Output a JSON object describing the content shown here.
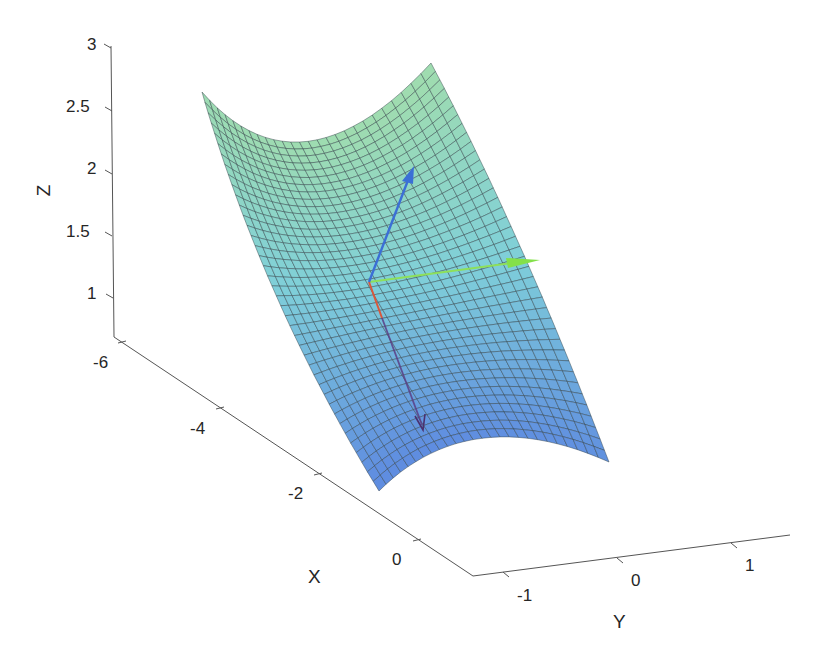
{
  "chart_data": {
    "type": "surface3d",
    "title": "",
    "xlabel": "X",
    "ylabel": "Y",
    "zlabel": "Z",
    "x_ticks": [
      "-6",
      "-4",
      "-2",
      "0"
    ],
    "y_ticks": [
      "-1",
      "0",
      "1"
    ],
    "z_ticks": [
      "1",
      "1.5",
      "2",
      "2.5",
      "3"
    ],
    "xlim": [
      -6.5,
      1
    ],
    "ylim": [
      -1.3,
      1.5
    ],
    "zlim": [
      0.75,
      3
    ],
    "grid": false,
    "surface": {
      "description": "saddle/trough-shaped parametric surface with mesh grid; curved trough along X",
      "colormap": "green (high Z) to blue (low Z)",
      "color_top": "#9fdcb0",
      "color_mid": "#7fcfd9",
      "color_bottom": "#5f8de0",
      "mesh_color": "#2f3f46",
      "grid_cols": 26,
      "grid_rows": 40
    },
    "vectors": [
      {
        "name": "blue-vector",
        "color": "#3b6fd6",
        "direction": "up (normal)"
      },
      {
        "name": "green-vector",
        "color": "#7fe04a",
        "direction": "+Y"
      },
      {
        "name": "red-vector",
        "color": "#d9573b",
        "direction": "+X (fading to dark purple)"
      }
    ]
  },
  "axes": {
    "z": {
      "label": "Z",
      "ticks": [
        {
          "label": "3",
          "x": 87,
          "y": 36
        },
        {
          "label": "2.5",
          "x": 66,
          "y": 98
        },
        {
          "label": "2",
          "x": 87,
          "y": 160
        },
        {
          "label": "1.5",
          "x": 66,
          "y": 223
        },
        {
          "label": "1",
          "x": 87,
          "y": 285
        }
      ]
    },
    "x": {
      "label": "X",
      "ticks": [
        {
          "label": "-6",
          "x": 93,
          "y": 354
        },
        {
          "label": "-4",
          "x": 190,
          "y": 420
        },
        {
          "label": "-2",
          "x": 288,
          "y": 485
        },
        {
          "label": "0",
          "x": 392,
          "y": 551
        }
      ]
    },
    "y": {
      "label": "Y",
      "ticks": [
        {
          "label": "-1",
          "x": 517,
          "y": 587
        },
        {
          "label": "0",
          "x": 631,
          "y": 572
        },
        {
          "label": "1",
          "x": 745,
          "y": 557
        }
      ]
    }
  }
}
